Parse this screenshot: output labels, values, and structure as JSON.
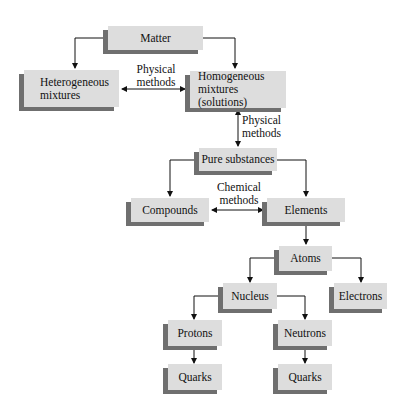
{
  "diagram": {
    "colors": {
      "box": "#dddddd",
      "shadow": "#6f6f6f",
      "line": "#111111",
      "background": "#ffffff"
    },
    "nodes": {
      "matter": {
        "label": "Matter"
      },
      "heterogeneous": {
        "label": "Heterogeneous\nmixtures"
      },
      "homogeneous": {
        "label": "Homogeneous\nmixtures (solutions)"
      },
      "pure": {
        "label": "Pure substances"
      },
      "compounds": {
        "label": "Compounds"
      },
      "elements": {
        "label": "Elements"
      },
      "atoms": {
        "label": "Atoms"
      },
      "nucleus": {
        "label": "Nucleus"
      },
      "electrons": {
        "label": "Electrons"
      },
      "protons": {
        "label": "Protons"
      },
      "neutrons": {
        "label": "Neutrons"
      },
      "quarks1": {
        "label": "Quarks"
      },
      "quarks2": {
        "label": "Quarks"
      }
    },
    "edge_labels": {
      "hetero_homo": "Physical\nmethods",
      "homo_pure": "Physical\nmethods",
      "compounds_elements": "Chemical\nmethods"
    },
    "edges": [
      {
        "from": "matter",
        "to": "heterogeneous",
        "type": "arrow"
      },
      {
        "from": "matter",
        "to": "homogeneous",
        "type": "arrow"
      },
      {
        "from": "heterogeneous",
        "to": "homogeneous",
        "type": "double-arrow",
        "label": "Physical methods"
      },
      {
        "from": "homogeneous",
        "to": "pure",
        "type": "double-arrow",
        "label": "Physical methods"
      },
      {
        "from": "pure",
        "to": "compounds",
        "type": "arrow"
      },
      {
        "from": "pure",
        "to": "elements",
        "type": "arrow"
      },
      {
        "from": "compounds",
        "to": "elements",
        "type": "double-arrow",
        "label": "Chemical methods"
      },
      {
        "from": "elements",
        "to": "atoms",
        "type": "arrow"
      },
      {
        "from": "atoms",
        "to": "nucleus",
        "type": "arrow"
      },
      {
        "from": "atoms",
        "to": "electrons",
        "type": "arrow"
      },
      {
        "from": "nucleus",
        "to": "protons",
        "type": "arrow"
      },
      {
        "from": "nucleus",
        "to": "neutrons",
        "type": "arrow"
      },
      {
        "from": "protons",
        "to": "quarks1",
        "type": "arrow"
      },
      {
        "from": "neutrons",
        "to": "quarks2",
        "type": "arrow"
      }
    ]
  }
}
